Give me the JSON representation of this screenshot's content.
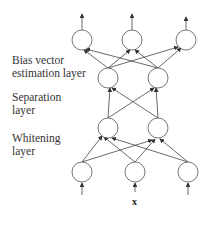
{
  "diagram": {
    "layers": [
      {
        "name": "Bias vector estimation layer",
        "label_lines": [
          "Bias vector",
          "estimation layer"
        ]
      },
      {
        "name": "Separation layer",
        "label_lines": [
          "Separation",
          "layer"
        ]
      },
      {
        "name": "Whitening layer",
        "label_lines": [
          "Whitening",
          "layer"
        ]
      }
    ],
    "input_label": "x",
    "nodes": {
      "output": [
        [
          82,
          40
        ],
        [
          132,
          40
        ],
        [
          186,
          40
        ]
      ],
      "separation": [
        [
          108,
          78
        ],
        [
          158,
          78
        ]
      ],
      "whitening": [
        [
          108,
          128
        ],
        [
          158,
          128
        ]
      ],
      "input": [
        [
          82,
          172
        ],
        [
          135,
          172
        ],
        [
          188,
          172
        ]
      ]
    },
    "colors": {
      "stroke": "#444444",
      "text": "#333333"
    }
  }
}
